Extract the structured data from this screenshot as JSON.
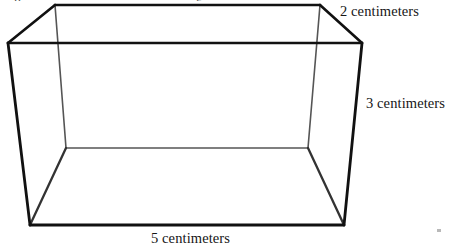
{
  "figure": {
    "kind": "rectangular-prism-line-drawing",
    "background_color": "#ffffff",
    "stroke_color_visible": "#111111",
    "stroke_color_hidden": "#555555",
    "stroke_width_visible": 2.6,
    "stroke_width_hidden": 1.5,
    "vertices": {
      "front_top_left": [
        8,
        43
      ],
      "front_top_right": [
        362,
        43
      ],
      "front_bottom_right": [
        344,
        225
      ],
      "front_bottom_left": [
        30,
        225
      ],
      "back_top_left": [
        55,
        5
      ],
      "back_top_right": [
        320,
        5
      ],
      "back_bottom_right": [
        308,
        148
      ],
      "back_bottom_left": [
        66,
        148
      ]
    }
  },
  "labels": {
    "depth": "2 centimeters",
    "height": "3 centimeters",
    "length": "5 centimeters"
  },
  "cropped_header": {
    "fragment_left": "p",
    "fragment_mid": "g"
  },
  "chart_data": {
    "type": "diagram",
    "title": "",
    "shape": "rectangular prism",
    "dimensions": [
      {
        "name": "length",
        "value": 5,
        "unit": "centimeters",
        "label": "5 centimeters",
        "edge": "front-bottom"
      },
      {
        "name": "height",
        "value": 3,
        "unit": "centimeters",
        "label": "3 centimeters",
        "edge": "front-right-vertical"
      },
      {
        "name": "depth",
        "value": 2,
        "unit": "centimeters",
        "label": "2 centimeters",
        "edge": "top-right-diagonal"
      }
    ]
  }
}
